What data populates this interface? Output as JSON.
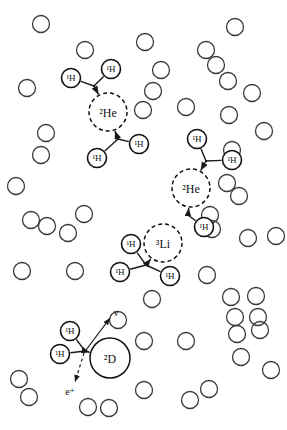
{
  "figure": {
    "width": 287,
    "height": 430,
    "background_color": "#ffffff",
    "ink_color": "#1a1a1a"
  },
  "style": {
    "free_proton_stroke": "#3a3a3a",
    "free_proton_radius": 8.5,
    "free_proton_stroke_width": 1.3,
    "reactant_stroke": "#111111",
    "reactant_radius": 9.5,
    "reactant_stroke_width": 1.6,
    "product_dashed_stroke": "#111111",
    "product_dashed_radius": 19,
    "product_solid_radius": 20,
    "dash_pattern": "4,3",
    "bond_stroke_width": 1.4,
    "emission_dash_pattern": "3,3"
  },
  "legend_symbols": {
    "hydrogen": "¹H",
    "helium2": "²He",
    "lithium3": "³Li",
    "deuterium": "²D",
    "positron": "e⁺",
    "neutrino": "ν"
  },
  "free_protons": [
    {
      "cx": 41,
      "cy": 24
    },
    {
      "cx": 85,
      "cy": 50
    },
    {
      "cx": 145,
      "cy": 42
    },
    {
      "cx": 235,
      "cy": 27
    },
    {
      "cx": 206,
      "cy": 50
    },
    {
      "cx": 216,
      "cy": 65
    },
    {
      "cx": 228,
      "cy": 81
    },
    {
      "cx": 252,
      "cy": 93
    },
    {
      "cx": 27,
      "cy": 88
    },
    {
      "cx": 161,
      "cy": 70
    },
    {
      "cx": 153,
      "cy": 91
    },
    {
      "cx": 143,
      "cy": 110
    },
    {
      "cx": 186,
      "cy": 107
    },
    {
      "cx": 229,
      "cy": 115
    },
    {
      "cx": 232,
      "cy": 150
    },
    {
      "cx": 264,
      "cy": 131
    },
    {
      "cx": 46,
      "cy": 133
    },
    {
      "cx": 41,
      "cy": 155
    },
    {
      "cx": 16,
      "cy": 186
    },
    {
      "cx": 227,
      "cy": 183
    },
    {
      "cx": 239,
      "cy": 196
    },
    {
      "cx": 31,
      "cy": 220
    },
    {
      "cx": 47,
      "cy": 226
    },
    {
      "cx": 68,
      "cy": 233
    },
    {
      "cx": 84,
      "cy": 214
    },
    {
      "cx": 22,
      "cy": 271
    },
    {
      "cx": 75,
      "cy": 271
    },
    {
      "cx": 210,
      "cy": 215
    },
    {
      "cx": 212,
      "cy": 229
    },
    {
      "cx": 248,
      "cy": 238
    },
    {
      "cx": 207,
      "cy": 275
    },
    {
      "cx": 231,
      "cy": 297
    },
    {
      "cx": 235,
      "cy": 317
    },
    {
      "cx": 258,
      "cy": 317
    },
    {
      "cx": 256,
      "cy": 296
    },
    {
      "cx": 152,
      "cy": 299
    },
    {
      "cx": 118,
      "cy": 320
    },
    {
      "cx": 144,
      "cy": 341
    },
    {
      "cx": 186,
      "cy": 341
    },
    {
      "cx": 237,
      "cy": 334
    },
    {
      "cx": 260,
      "cy": 330
    },
    {
      "cx": 241,
      "cy": 357
    },
    {
      "cx": 19,
      "cy": 379
    },
    {
      "cx": 29,
      "cy": 397
    },
    {
      "cx": 88,
      "cy": 407
    },
    {
      "cx": 109,
      "cy": 408
    },
    {
      "cx": 144,
      "cy": 390
    },
    {
      "cx": 190,
      "cy": 400
    },
    {
      "cx": 209,
      "cy": 389
    },
    {
      "cx": 271,
      "cy": 370
    },
    {
      "cx": 276,
      "cy": 236
    }
  ],
  "reactions": [
    {
      "id": "reaction-he2-upper",
      "product": {
        "label": "²He",
        "cx": 108,
        "cy": 112,
        "kind": "dashed"
      },
      "incoming": {
        "junction": {
          "x": 94,
          "y": 86
        },
        "reactants": [
          {
            "label": "¹H",
            "cx": 71,
            "cy": 78
          },
          {
            "label": "¹H",
            "cx": 111,
            "cy": 69
          }
        ]
      },
      "outgoing": {
        "junction": {
          "x": 118,
          "y": 139
        },
        "reactants": [
          {
            "label": "¹H",
            "cx": 97,
            "cy": 158
          },
          {
            "label": "¹H",
            "cx": 139,
            "cy": 144
          }
        ]
      }
    },
    {
      "id": "reaction-he2-lower",
      "product": {
        "label": "²He",
        "cx": 191,
        "cy": 188,
        "kind": "dashed"
      },
      "incoming": {
        "junction": {
          "x": 206,
          "y": 161
        },
        "reactants": [
          {
            "label": "¹H",
            "cx": 197,
            "cy": 139
          },
          {
            "label": "¹H",
            "cx": 232,
            "cy": 160
          }
        ]
      },
      "outgoing": {
        "junction": {
          "x": 188,
          "y": 215
        },
        "reactants": [
          {
            "label": "¹H",
            "cx": 204,
            "cy": 227
          }
        ]
      }
    },
    {
      "id": "reaction-li3",
      "product": {
        "label": "³Li",
        "cx": 163,
        "cy": 243,
        "kind": "dashed"
      },
      "incoming": {
        "junction": {
          "x": 146,
          "y": 265
        },
        "reactants": [
          {
            "label": "¹H",
            "cx": 131,
            "cy": 244
          },
          {
            "label": "¹H",
            "cx": 120,
            "cy": 272
          },
          {
            "label": "¹H",
            "cx": 170,
            "cy": 276
          }
        ]
      }
    },
    {
      "id": "reaction-deuterium-decay",
      "product": {
        "label": "²D",
        "cx": 110,
        "cy": 358,
        "kind": "solid"
      },
      "incoming": {
        "junction": {
          "x": 85,
          "y": 351
        },
        "reactants": [
          {
            "label": "¹H",
            "cx": 70,
            "cy": 331
          },
          {
            "label": "¹H",
            "cx": 60,
            "cy": 354
          }
        ]
      },
      "emissions": [
        {
          "label": "ν",
          "kind": "arrow-solid",
          "from": {
            "x": 86,
            "y": 350
          },
          "to": {
            "x": 110,
            "y": 318
          },
          "label_x": 116,
          "label_y": 316
        },
        {
          "label": "e⁺",
          "kind": "arrow-dashed",
          "from": {
            "x": 84,
            "y": 353
          },
          "to": {
            "x": 75,
            "y": 382
          },
          "label_x": 70,
          "label_y": 395
        }
      ]
    }
  ]
}
